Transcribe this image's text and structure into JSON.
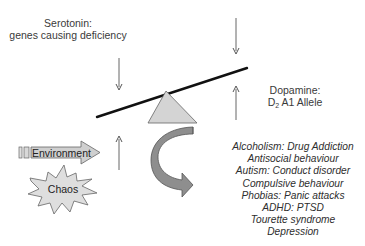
{
  "diagram": {
    "serotonin": {
      "line1": "Serotonin:",
      "line2": "genes causing deficiency"
    },
    "dopamine": {
      "line1": "Dopamine:",
      "line2_prefix": "D",
      "line2_sub": "2",
      "line2_suffix": " A1 Allele"
    },
    "environment_label": "Environment",
    "chaos_label": "Chaos",
    "outcomes": [
      "Alcoholism: Drug Addiction",
      "Antisocial behaviour",
      "Autism: Conduct disorder",
      "Compulsive behaviour",
      "Phobias: Panic attacks",
      "ADHD: PTSD",
      "Tourette syndrome",
      "Depression"
    ],
    "icons": {
      "down-arrow-left": "arrow-down",
      "down-arrow-right": "arrow-down",
      "up-arrow-right": "arrow-up",
      "up-arrow-left": "arrow-up",
      "seesaw-beam": "line",
      "fulcrum": "triangle",
      "curved-arrow": "curved-arrow",
      "environment-arrow": "block-arrow",
      "chaos-burst": "starburst"
    },
    "colors": {
      "beam": "#111111",
      "fulcrum_fill": "#d4d4d4",
      "fulcrum_stroke": "#555555",
      "curved_arrow_fill": "#8c8c8c",
      "environment_fill": "#cfcfcf",
      "chaos_fill": "#dedede",
      "thin_arrow": "#555555"
    }
  }
}
